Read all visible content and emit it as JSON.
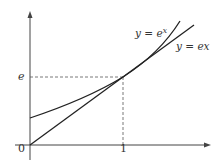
{
  "diagram": {
    "title": "",
    "axes": {
      "origin_label": "0",
      "x_tick_label": "1",
      "y_tick_label": "e"
    },
    "curves": [
      {
        "name": "exponential",
        "label_base": "y = e",
        "label_sup": "x"
      },
      {
        "name": "tangent-line",
        "label": "y = ex"
      }
    ],
    "colors": {
      "stroke": "#222222",
      "dashed": "#555555",
      "text": "#333333"
    }
  }
}
